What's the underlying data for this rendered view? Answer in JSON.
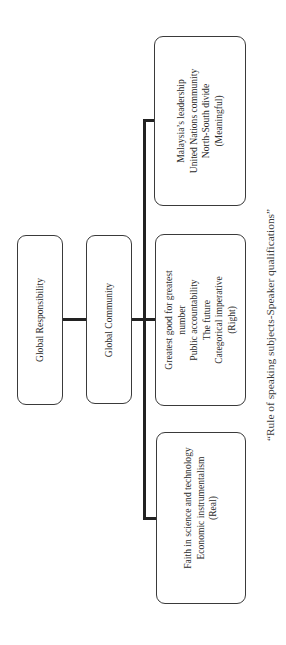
{
  "diagram": {
    "orientation": "rotated-90-ccw",
    "nodes": {
      "root": {
        "label": "Global Responsibility"
      },
      "level2": {
        "label": "Global Community"
      },
      "children": [
        {
          "id": "meaningful",
          "lines": [
            "Malaysia’s leadership",
            "United Nations community",
            "North-South divide",
            "(Meaningful)"
          ]
        },
        {
          "id": "right",
          "lines": [
            "Greatest good for greatest",
            "number",
            "Public accountability",
            "The future",
            "Categorical imperative",
            "(Right)"
          ]
        },
        {
          "id": "real",
          "lines": [
            "Faith in science and technology",
            "Economic instrumentalism",
            "(Real)"
          ]
        }
      ]
    },
    "edges": [
      {
        "from": "Global Responsibility",
        "to": "Global Community"
      },
      {
        "from": "Global Community",
        "to": "(Meaningful)"
      },
      {
        "from": "Global Community",
        "to": "(Right)"
      },
      {
        "from": "Global Community",
        "to": "(Real)"
      }
    ],
    "caption": "“Rule of speaking subjects-Speaker qualifications”",
    "colors": {
      "line": "#222222",
      "box_border": "#3a3a3a",
      "text": "#2a2a2a",
      "background": "#ffffff"
    }
  }
}
